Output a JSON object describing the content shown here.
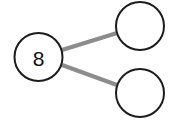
{
  "canvas": {
    "width": 172,
    "height": 125,
    "background": "#ffffff"
  },
  "style": {
    "node_stroke_color": "#1c1c1c",
    "node_fill_color": "#ffffff",
    "node_stroke_width": 2,
    "edge_color": "#8c8c8c",
    "edge_width": 4,
    "label_color": "#111111",
    "label_font_size": 21
  },
  "diagram": {
    "type": "node-link-graph",
    "title": "",
    "nodes": [
      {
        "id": "root",
        "label": "8",
        "cx": 38.5,
        "cy": 57,
        "r": 24,
        "filled": false
      },
      {
        "id": "child-top",
        "label": "",
        "cx": 140,
        "cy": 26,
        "r": 24,
        "filled": false
      },
      {
        "id": "child-bottom",
        "label": "",
        "cx": 140,
        "cy": 93,
        "r": 24,
        "filled": false
      }
    ],
    "edges": [
      {
        "id": "edge-root-top",
        "from": "root",
        "to": "child-top",
        "x1": 62,
        "y1": 50,
        "x2": 117,
        "y2": 33
      },
      {
        "id": "edge-root-bottom",
        "from": "root",
        "to": "child-bottom",
        "x1": 62,
        "y1": 65,
        "x2": 117,
        "y2": 85
      }
    ]
  }
}
